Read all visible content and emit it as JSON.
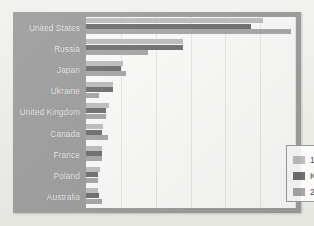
{
  "chart_data": {
    "type": "bar",
    "orientation": "horizontal",
    "title": "",
    "subtitle": "",
    "xlabel": "",
    "ylabel": "",
    "grid": true,
    "legend_position": "inside-bottom-right",
    "xlim": [
      0,
      7200
    ],
    "x_gridline_values": [
      1200,
      2400,
      3600,
      4800,
      6000,
      7200
    ],
    "categories": [
      "United States",
      "Russia",
      "Japan",
      "Ukraine",
      "United Kingdom",
      "Canada",
      "France",
      "Poland",
      "Australia"
    ],
    "series": [
      {
        "name": "1990",
        "color": "#bdbdbd",
        "values": [
          6100,
          3350,
          1270,
          920,
          780,
          600,
          560,
          480,
          420
        ]
      },
      {
        "name": "Kyoto target",
        "color": "#6f6f6f",
        "values": [
          5680,
          3350,
          1190,
          920,
          680,
          560,
          560,
          420,
          450
        ]
      },
      {
        "name": "2007",
        "color": "#a6a6a6",
        "values": [
          7050,
          2150,
          1380,
          440,
          700,
          750,
          540,
          400,
          540
        ]
      }
    ]
  },
  "legend": {
    "items": [
      {
        "label": "1990",
        "color": "#bdbdbd"
      },
      {
        "label": "Kyoto target",
        "color": "#6f6f6f"
      },
      {
        "label": "2007",
        "color": "#a6a6a6"
      }
    ]
  },
  "colors": {
    "page_background": "#efefea",
    "panel_background": "#9d9d9d",
    "plot_background": "#fbfbfa",
    "gridline": "#e7e7e4",
    "label_text": "#f2f2f0",
    "legend_text": "#4a4a4a",
    "legend_border": "#9b9b9b"
  }
}
